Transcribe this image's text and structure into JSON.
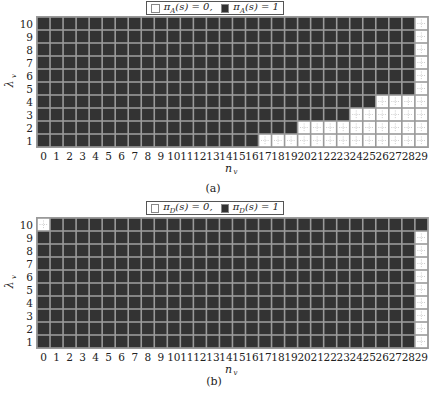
{
  "chart_data": [
    {
      "type": "heatmap",
      "panel_caption": "(a)",
      "legend": [
        {
          "label": "π_A(s) = 0,",
          "color": "#ffffff"
        },
        {
          "label": "π_A(s) = 1",
          "color": "#333333"
        }
      ],
      "xlabel": "n_v",
      "ylabel": "λ_v",
      "x_ticks": [
        0,
        1,
        2,
        3,
        4,
        5,
        6,
        7,
        8,
        9,
        10,
        11,
        12,
        13,
        14,
        15,
        16,
        17,
        18,
        19,
        20,
        21,
        22,
        23,
        24,
        25,
        26,
        27,
        28,
        29
      ],
      "y_ticks": [
        1,
        2,
        3,
        4,
        5,
        6,
        7,
        8,
        9,
        10
      ],
      "grid": true,
      "legend_position": "top-center",
      "value_rule": "value 0 (white) for listed columns per row, else 1 (dark)",
      "zeros_by_row": {
        "1": [
          17,
          18,
          19,
          20,
          21,
          22,
          23,
          24,
          25,
          26,
          27,
          28,
          29
        ],
        "2": [
          20,
          21,
          22,
          23,
          24,
          25,
          26,
          27,
          28,
          29
        ],
        "3": [
          24,
          25,
          26,
          27,
          28,
          29
        ],
        "4": [
          26,
          27,
          28,
          29
        ],
        "5": [
          29
        ],
        "6": [
          29
        ],
        "7": [
          29
        ],
        "8": [
          29
        ],
        "9": [
          29
        ],
        "10": [
          29
        ]
      }
    },
    {
      "type": "heatmap",
      "panel_caption": "(b)",
      "legend": [
        {
          "label": "π_D(s) = 0,",
          "color": "#ffffff"
        },
        {
          "label": "π_D(s) = 1",
          "color": "#333333"
        }
      ],
      "xlabel": "n_v",
      "ylabel": "λ_v",
      "x_ticks": [
        0,
        1,
        2,
        3,
        4,
        5,
        6,
        7,
        8,
        9,
        10,
        11,
        12,
        13,
        14,
        15,
        16,
        17,
        18,
        19,
        20,
        21,
        22,
        23,
        24,
        25,
        26,
        27,
        28,
        29
      ],
      "y_ticks": [
        1,
        2,
        3,
        4,
        5,
        6,
        7,
        8,
        9,
        10
      ],
      "grid": true,
      "legend_position": "top-center",
      "value_rule": "value 0 (white) for listed columns per row, else 1 (dark)",
      "zeros_by_row": {
        "1": [
          29
        ],
        "2": [
          29
        ],
        "3": [
          29
        ],
        "4": [
          29
        ],
        "5": [
          29
        ],
        "6": [
          29
        ],
        "7": [
          29
        ],
        "8": [
          29
        ],
        "9": [
          29
        ],
        "10": [
          0
        ]
      }
    }
  ],
  "legend_a": {
    "zero": "π",
    "zero_sub": "A",
    "zero_rest": "(s) = 0,",
    "one": "π",
    "one_sub": "A",
    "one_rest": "(s) = 1"
  },
  "legend_b": {
    "zero": "π",
    "zero_sub": "D",
    "zero_rest": "(s) = 0,",
    "one": "π",
    "one_sub": "D",
    "one_rest": "(s) = 1"
  },
  "captions": {
    "a": "(a)",
    "b": "(b)"
  },
  "colors": {
    "one": "#333333",
    "zero": "#ffffff",
    "gridline": "#9a9a9a"
  }
}
